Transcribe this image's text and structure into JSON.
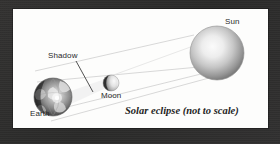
{
  "figure": {
    "type": "astronomical-diagram",
    "subject": "solar eclipse",
    "caption": "Solar eclipse (not to scale)",
    "background_color": "#fdfdfc",
    "frame_color": "#2d2d2d",
    "ink_color": "#2a2a2a"
  },
  "labels": {
    "sun": "Sun",
    "shadow": "Shadow",
    "moon": "Moon",
    "earth": "Earth"
  },
  "bodies": [
    {
      "id": "sun",
      "label": "Sun",
      "cx": 204,
      "cy": 44,
      "r": 27,
      "fill_light": "#f2f2f2",
      "fill_dark": "#808080"
    },
    {
      "id": "moon",
      "label": "Moon",
      "cx": 98,
      "cy": 74,
      "r": 8,
      "fill_light": "#f0f0f0",
      "fill_dark": "#2e2e2e"
    },
    {
      "id": "earth",
      "label": "Earth",
      "cx": 40,
      "cy": 88,
      "r": 19,
      "fill_light": "#efefef",
      "fill_dark": "#1c1c1c"
    }
  ],
  "rays": {
    "color": "#d0d0d0",
    "count": 4,
    "description": "tangent light rays from Sun past Moon onto Earth"
  },
  "leader_line": {
    "from_label": "Shadow",
    "color": "#3a3a3a"
  }
}
